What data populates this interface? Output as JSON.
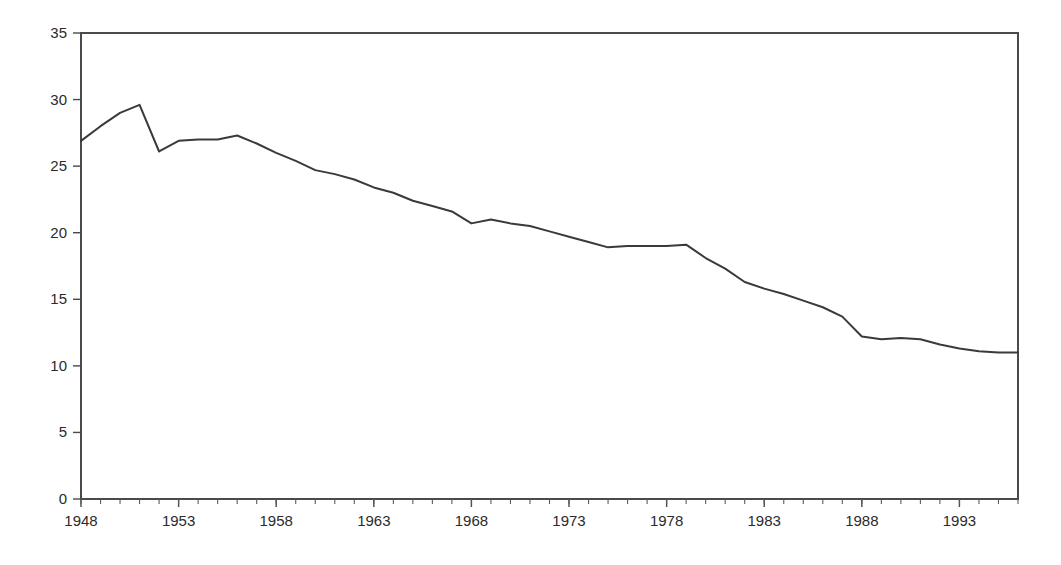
{
  "chart_data": {
    "type": "line",
    "title": "",
    "subtitle": "",
    "xlabel": "",
    "ylabel": "",
    "xlim": [
      1948,
      1996
    ],
    "ylim": [
      0,
      35
    ],
    "y_ticks": [
      0,
      5,
      10,
      15,
      20,
      25,
      30,
      35
    ],
    "y_tick_labels": [
      "0",
      "5",
      "10",
      "15",
      "20",
      "25",
      "30",
      "35"
    ],
    "x_ticks": [
      1948,
      1953,
      1958,
      1963,
      1968,
      1973,
      1978,
      1983,
      1988,
      1993
    ],
    "x_tick_labels": [
      "1948",
      "1953",
      "1958",
      "1963",
      "1968",
      "1973",
      "1978",
      "1983",
      "1988",
      "1993"
    ],
    "x_minor_tick_step": 1,
    "grid": false,
    "legend": false,
    "legend_position": "none",
    "annotations": [],
    "line_color": "#3a3a3a",
    "frame_color": "#4a4a4a",
    "background_color": "#ffffff",
    "x": [
      1948,
      1949,
      1950,
      1951,
      1952,
      1953,
      1954,
      1955,
      1956,
      1957,
      1958,
      1959,
      1960,
      1961,
      1962,
      1963,
      1964,
      1965,
      1966,
      1967,
      1968,
      1969,
      1970,
      1971,
      1972,
      1973,
      1974,
      1975,
      1976,
      1977,
      1978,
      1979,
      1980,
      1981,
      1982,
      1983,
      1984,
      1985,
      1986,
      1987,
      1988,
      1989,
      1990,
      1991,
      1992,
      1993,
      1994,
      1995,
      1996
    ],
    "series": [
      {
        "name": "",
        "values": [
          26.9,
          28.0,
          29.0,
          29.6,
          26.1,
          26.9,
          27.0,
          27.0,
          27.3,
          26.7,
          26.0,
          25.4,
          24.7,
          24.4,
          24.0,
          23.4,
          23.0,
          22.4,
          22.0,
          21.6,
          20.7,
          21.0,
          20.7,
          20.5,
          20.1,
          19.7,
          19.3,
          18.9,
          19.0,
          19.0,
          19.0,
          19.1,
          18.1,
          17.3,
          16.3,
          15.8,
          15.4,
          14.9,
          14.4,
          13.7,
          12.2,
          12.0,
          12.1,
          12.0,
          11.6,
          11.3,
          11.1,
          11.0,
          11.0
        ]
      }
    ]
  },
  "layout": {
    "plot_left": 81,
    "plot_right": 1018,
    "plot_top": 33,
    "plot_bottom": 499
  }
}
